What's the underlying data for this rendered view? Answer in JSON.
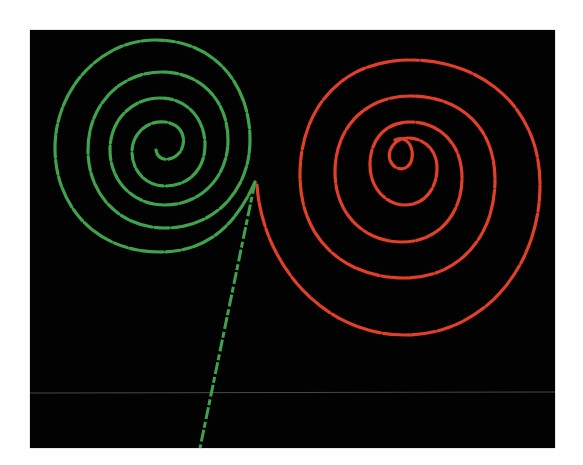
{
  "image": {
    "description": "Bubble-chamber style photograph: two oppositely curling particle spirals (green and red) originating from a common vertex, with a straight green track leaving downward",
    "background_color": "#020202",
    "page_color": "#fefefe",
    "ghost_text_top": "show-through text",
    "ghost_text_bottom": "show-through text",
    "tracks": [
      {
        "name": "green-spiral",
        "color": "#3fa34d",
        "center": [
          160,
          148
        ],
        "direction": "counter-clockwise"
      },
      {
        "name": "red-spiral",
        "color": "#e0402a",
        "center": [
          402,
          150
        ],
        "direction": "clockwise"
      },
      {
        "name": "green-straight-track",
        "color": "#3fa34d",
        "from": [
          255,
          182
        ],
        "to": [
          200,
          448
        ]
      }
    ],
    "vertex": [
      255,
      182
    ],
    "horizontal_line_y": 393
  }
}
